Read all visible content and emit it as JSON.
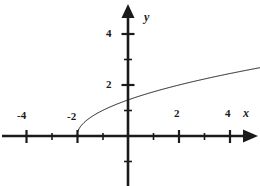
{
  "figure": {
    "background_color": "#ffffff",
    "ink_color": "#1a1a1a"
  },
  "axes": {
    "x_axis_name": "x",
    "y_axis_name": "y",
    "x_labels": [
      {
        "text": "-4",
        "value": -4
      },
      {
        "text": "-2",
        "value": -2
      },
      {
        "text": "2",
        "value": 2
      },
      {
        "text": "4",
        "value": 4
      }
    ],
    "y_labels": [
      {
        "text": "4",
        "value": 4
      },
      {
        "text": "2",
        "value": 2
      }
    ]
  },
  "chart_data": {
    "type": "line",
    "title": "",
    "subtitle": "",
    "xlabel": "x",
    "ylabel": "y",
    "xlim": [
      -5.0,
      5.2
    ],
    "ylim": [
      -2.0,
      5.5
    ],
    "grid": false,
    "legend": null,
    "x_major_ticks": [
      -4,
      -2,
      2,
      4
    ],
    "x_minor_ticks": [
      -3,
      -1,
      1,
      3
    ],
    "y_major_ticks": [
      2,
      4
    ],
    "y_minor_ticks": [
      -1,
      1,
      3
    ],
    "x_tick_labels": [
      "-4",
      "-2",
      "2",
      "4"
    ],
    "y_tick_labels": [
      "2",
      "4"
    ],
    "origin_label": "",
    "annotations": [],
    "series": [
      {
        "name": "y = sqrt(x + 2)",
        "equation": "y = sqrt(x + 2)",
        "domain": [
          -2,
          5.2
        ],
        "start_point": [
          -2,
          0
        ],
        "x": [
          -2,
          -1.75,
          -1.5,
          -1.25,
          -1,
          -0.5,
          0,
          0.5,
          1,
          1.5,
          2,
          2.5,
          3,
          3.5,
          4,
          4.5,
          5,
          5.2
        ],
        "values": [
          0,
          0.5,
          0.707,
          0.866,
          1,
          1.225,
          1.414,
          1.581,
          1.732,
          1.871,
          2,
          2.121,
          2.236,
          2.345,
          2.449,
          2.55,
          2.646,
          2.683
        ],
        "color": "#1a1a1a",
        "linewidth": 1
      }
    ]
  }
}
